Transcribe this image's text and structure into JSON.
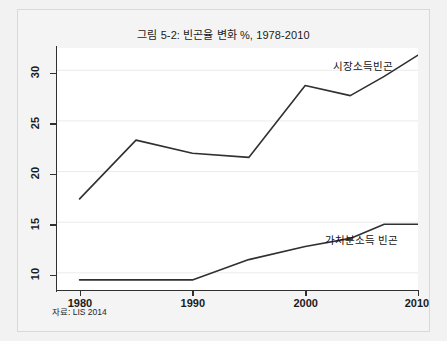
{
  "figure": {
    "title": "그림 5-2: 빈곤율 변화 %, 1978-2010",
    "source_note": "자료: LIS 2014",
    "background_color": "#f2f2f2",
    "plot_background_color": "#ffffff",
    "line_color": "#303030",
    "gridline_color": "#e8e8e8"
  },
  "chart_data": {
    "type": "line",
    "title": "그림 5-2: 빈곤율 변화 %, 1978-2010",
    "xlabel": "",
    "ylabel": "",
    "xlim": [
      1978,
      2010
    ],
    "ylim": [
      8.3,
      32.2
    ],
    "xticks": [
      1980,
      1990,
      2000,
      2010
    ],
    "xtick_labels": [
      "1980",
      "1990",
      "2000",
      "2010"
    ],
    "yticks": [
      10,
      15,
      20,
      25,
      30
    ],
    "ytick_labels": [
      "10",
      "15",
      "20",
      "25",
      "30"
    ],
    "grid": true,
    "grid_axis": "y",
    "legend": "inline-labels",
    "annotations": [
      "시장소득빈곤",
      "가처분소득 빈곤"
    ],
    "series": [
      {
        "name": "시장소득빈곤",
        "label_position": "upper-right",
        "x": [
          1980,
          1985,
          1990,
          1995,
          2000,
          2004,
          2007,
          2010
        ],
        "values": [
          17.3,
          23.1,
          21.8,
          21.4,
          28.5,
          27.5,
          29.4,
          31.5
        ]
      },
      {
        "name": "가처분소득 빈곤",
        "label_position": "lower-right",
        "x": [
          1980,
          1985,
          1990,
          1995,
          2000,
          2004,
          2007,
          2010
        ],
        "values": [
          9.3,
          9.3,
          9.3,
          11.3,
          12.6,
          13.4,
          14.8,
          14.8
        ]
      }
    ]
  },
  "axes": {
    "y_ticks": [
      {
        "label": "30"
      },
      {
        "label": "25"
      },
      {
        "label": "20"
      },
      {
        "label": "15"
      },
      {
        "label": "10"
      }
    ],
    "x_ticks": [
      {
        "label": "1980"
      },
      {
        "label": "1990"
      },
      {
        "label": "2000"
      },
      {
        "label": "2010"
      }
    ]
  },
  "labels": {
    "market_income": "시장소득빈곤",
    "disposable_income": "가처분소득 빈곤"
  }
}
